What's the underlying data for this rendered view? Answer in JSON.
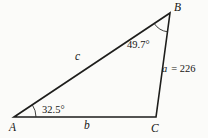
{
  "figure": {
    "type": "triangle-diagram",
    "background_color": "#fbfbf9",
    "line_color": "#1d1d1b",
    "text_color": "#151513",
    "vertices": {
      "A": {
        "label": "A"
      },
      "B": {
        "label": "B"
      },
      "C": {
        "label": "C"
      }
    },
    "angles": {
      "A": {
        "label": "32.5°",
        "value": 32.5
      },
      "B": {
        "label": "49.7°",
        "value": 49.7
      }
    },
    "sides": {
      "a": {
        "symbol": "a",
        "equals_value": "= 226",
        "value": 226
      },
      "b": {
        "symbol": "b"
      },
      "c": {
        "symbol": "c"
      }
    }
  }
}
